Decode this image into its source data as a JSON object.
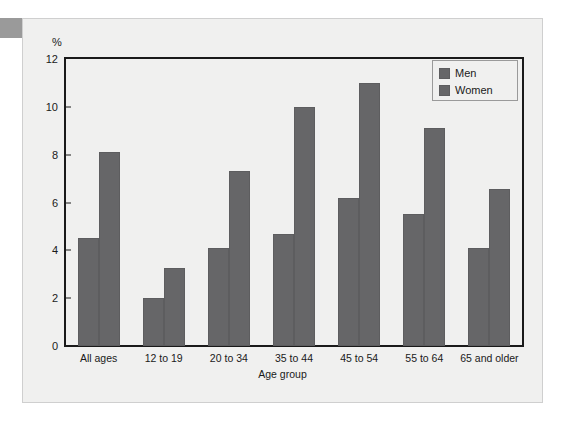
{
  "figure": {
    "y_unit_label": "%",
    "x_axis_title": "Age group"
  },
  "legend": {
    "items": [
      {
        "label": "Men",
        "color": "#666668"
      },
      {
        "label": "Women",
        "color": "#666668"
      }
    ]
  },
  "colors": {
    "bar_fill": "#666668",
    "bar_stroke": "#5d5d5f",
    "axis": "#1a1a1a",
    "panel_background": "#f0f0ef",
    "page_background": "#ffffff",
    "corner_tab": "#9a9a9a",
    "panel_border": "#cfcfcf"
  },
  "chart_data": {
    "type": "bar",
    "title": "",
    "xlabel": "Age group",
    "ylabel": "%",
    "ylim": [
      0,
      12
    ],
    "yticks": [
      0,
      2,
      4,
      6,
      8,
      10,
      12
    ],
    "ytick_labels": [
      "0",
      "2",
      "4",
      "6",
      "8",
      "10",
      "12"
    ],
    "grid": false,
    "legend_position": "top-right",
    "categories": [
      "All ages",
      "12 to 19",
      "20 to 34",
      "35 to 44",
      "45 to 54",
      "55 to 64",
      "65 and older"
    ],
    "series": [
      {
        "name": "Men",
        "values": [
          4.5,
          2.0,
          4.1,
          4.7,
          6.2,
          5.5,
          4.1
        ]
      },
      {
        "name": "Women",
        "values": [
          8.1,
          3.25,
          7.3,
          10.0,
          11.0,
          9.1,
          6.55
        ]
      }
    ]
  }
}
